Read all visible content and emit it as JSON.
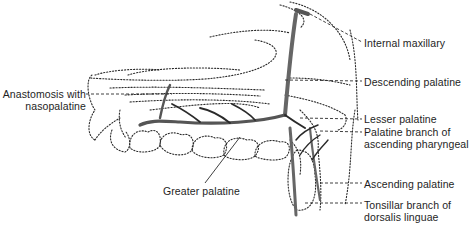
{
  "figure": {
    "colors": {
      "line": "#2a2a2a",
      "vessel_fill": "#8a8a8a",
      "background": "#ffffff"
    }
  },
  "labels": {
    "internal_maxillary": "Internal maxillary",
    "descending_palatine": "Descending palatine",
    "anastomosis_line1": "Anastomosis with",
    "anastomosis_line2": "nasopalatine",
    "lesser_palatine": "Lesser palatine",
    "palatine_branch_line1": "Palatine branch of",
    "palatine_branch_line2": "ascending pharyngeal",
    "greater_palatine": "Greater palatine",
    "ascending_palatine": "Ascending palatine",
    "tonsillar_line1": "Tonsillar branch of",
    "tonsillar_line2": "dorsalis linguae"
  }
}
